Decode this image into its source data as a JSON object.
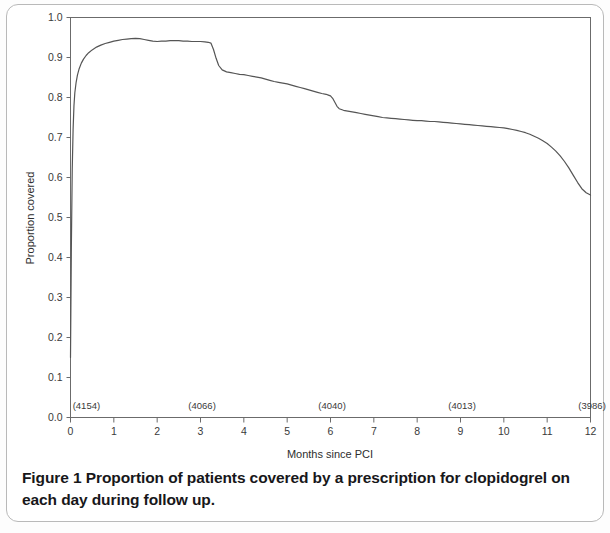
{
  "figure": {
    "caption_label": "Figure 1",
    "caption_text": "Proportion of patients covered by a prescription for clopidogrel on each day during follow up."
  },
  "chart_data": {
    "type": "line",
    "title": "",
    "xlabel": "Months since PCI",
    "ylabel": "Proportion covered",
    "xlim": [
      0,
      12
    ],
    "ylim": [
      0.0,
      1.0
    ],
    "grid": false,
    "legend": "none",
    "x_ticks": [
      "0",
      "1",
      "2",
      "3",
      "4",
      "5",
      "6",
      "7",
      "8",
      "9",
      "10",
      "11",
      "12"
    ],
    "y_ticks": [
      "0.0",
      "0.1",
      "0.2",
      "0.3",
      "0.4",
      "0.5",
      "0.6",
      "0.7",
      "0.8",
      "0.9",
      "1.0"
    ],
    "line_color": "#555555",
    "axis_color": "#6b6b6b",
    "annotations": [
      {
        "label": "(4154)",
        "x": 0.05,
        "y": 0.015
      },
      {
        "label": "(4066)",
        "x": 2.72,
        "y": 0.015
      },
      {
        "label": "(4040)",
        "x": 5.72,
        "y": 0.015
      },
      {
        "label": "(4013)",
        "x": 8.72,
        "y": 0.015
      },
      {
        "label": "(3986)",
        "x": 11.72,
        "y": 0.015
      }
    ],
    "series": [
      {
        "name": "Proportion covered",
        "x": [
          0.0,
          0.02,
          0.04,
          0.06,
          0.08,
          0.1,
          0.13,
          0.16,
          0.2,
          0.25,
          0.3,
          0.36,
          0.42,
          0.5,
          0.6,
          0.7,
          0.8,
          0.9,
          1.0,
          1.1,
          1.2,
          1.3,
          1.4,
          1.5,
          1.6,
          1.7,
          1.8,
          1.9,
          2.0,
          2.1,
          2.2,
          2.3,
          2.4,
          2.5,
          2.6,
          2.7,
          2.8,
          2.9,
          3.0,
          3.1,
          3.18,
          3.24,
          3.3,
          3.36,
          3.42,
          3.5,
          3.6,
          3.7,
          3.8,
          3.9,
          4.0,
          4.1,
          4.2,
          4.3,
          4.4,
          4.5,
          4.6,
          4.7,
          4.8,
          4.9,
          5.0,
          5.1,
          5.2,
          5.3,
          5.4,
          5.5,
          5.6,
          5.7,
          5.8,
          5.9,
          5.95,
          6.0,
          6.05,
          6.1,
          6.15,
          6.2,
          6.3,
          6.4,
          6.5,
          6.6,
          6.7,
          6.8,
          6.9,
          7.0,
          7.1,
          7.2,
          7.3,
          7.4,
          7.5,
          7.6,
          7.7,
          7.8,
          7.9,
          8.0,
          8.1,
          8.2,
          8.3,
          8.4,
          8.5,
          8.6,
          8.7,
          8.8,
          8.9,
          9.0,
          9.1,
          9.2,
          9.3,
          9.4,
          9.5,
          9.6,
          9.7,
          9.8,
          9.9,
          10.0,
          10.1,
          10.2,
          10.3,
          10.4,
          10.5,
          10.6,
          10.7,
          10.8,
          10.9,
          11.0,
          11.1,
          11.2,
          11.3,
          11.4,
          11.5,
          11.6,
          11.7,
          11.8,
          11.9,
          12.0
        ],
        "y": [
          0.15,
          0.43,
          0.62,
          0.72,
          0.78,
          0.812,
          0.838,
          0.856,
          0.872,
          0.886,
          0.896,
          0.905,
          0.912,
          0.919,
          0.926,
          0.931,
          0.935,
          0.938,
          0.941,
          0.943,
          0.945,
          0.946,
          0.947,
          0.948,
          0.947,
          0.945,
          0.943,
          0.941,
          0.94,
          0.941,
          0.941,
          0.942,
          0.942,
          0.942,
          0.941,
          0.941,
          0.94,
          0.94,
          0.94,
          0.939,
          0.938,
          0.936,
          0.92,
          0.898,
          0.88,
          0.869,
          0.864,
          0.862,
          0.86,
          0.858,
          0.857,
          0.855,
          0.853,
          0.851,
          0.849,
          0.846,
          0.843,
          0.84,
          0.838,
          0.836,
          0.834,
          0.831,
          0.828,
          0.825,
          0.822,
          0.819,
          0.816,
          0.813,
          0.81,
          0.808,
          0.806,
          0.804,
          0.798,
          0.788,
          0.778,
          0.772,
          0.768,
          0.766,
          0.764,
          0.762,
          0.76,
          0.758,
          0.756,
          0.754,
          0.752,
          0.75,
          0.749,
          0.748,
          0.747,
          0.746,
          0.745,
          0.744,
          0.743,
          0.742,
          0.742,
          0.741,
          0.74,
          0.74,
          0.739,
          0.738,
          0.737,
          0.736,
          0.735,
          0.734,
          0.733,
          0.732,
          0.731,
          0.73,
          0.729,
          0.728,
          0.727,
          0.726,
          0.725,
          0.724,
          0.722,
          0.72,
          0.718,
          0.715,
          0.712,
          0.708,
          0.703,
          0.698,
          0.692,
          0.685,
          0.676,
          0.666,
          0.654,
          0.64,
          0.624,
          0.606,
          0.588,
          0.572,
          0.562,
          0.556
        ]
      }
    ]
  }
}
